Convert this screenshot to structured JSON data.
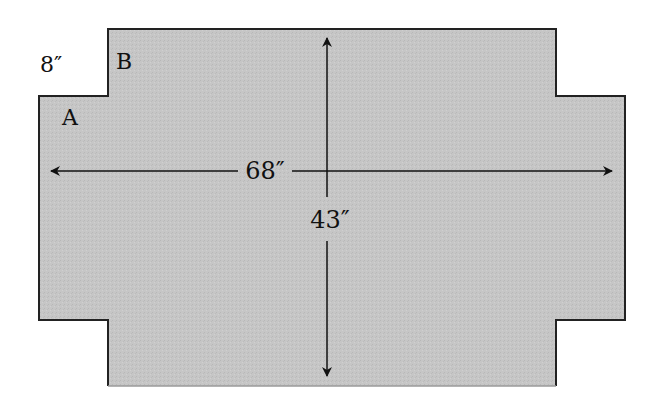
{
  "diagram": {
    "type": "plus-shaped table/board outline with dimensions",
    "colors": {
      "fill": "#c4c4c4",
      "outline": "#222222",
      "bottom_edge": "#9a9a9a",
      "arrows": "#111111",
      "background": "#ffffff"
    },
    "labels": {
      "notch_size": "8″",
      "corner_a": "A",
      "corner_b": "B",
      "width": "68″",
      "height": "43″"
    },
    "dimensions": {
      "width_in": 68,
      "height_in": 43,
      "notch_in": 8
    }
  }
}
